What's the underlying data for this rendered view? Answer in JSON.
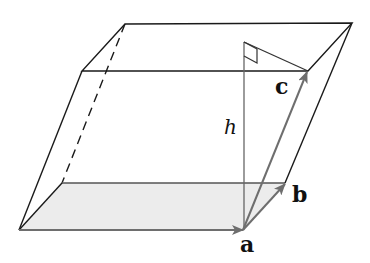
{
  "figure": {
    "labels": {
      "a": "a",
      "b": "b",
      "c": "c",
      "h": "h"
    },
    "colors": {
      "edge": "#1a1a1a",
      "vector": "#707070",
      "base_fill": "#ececec",
      "height_line": "#666666"
    }
  }
}
